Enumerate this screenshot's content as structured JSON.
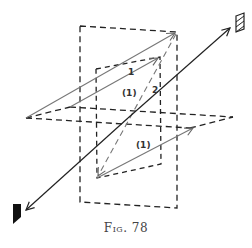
{
  "figure": {
    "caption": "Fig. 78",
    "labels": {
      "vector_1": "1",
      "vector_1_upper_projection": "(1)",
      "vector_2": "2",
      "vector_1_lower_projection": "(1)"
    },
    "colors": {
      "ink": "#222222",
      "grey_vector": "#777777",
      "background": "#ffffff"
    }
  }
}
